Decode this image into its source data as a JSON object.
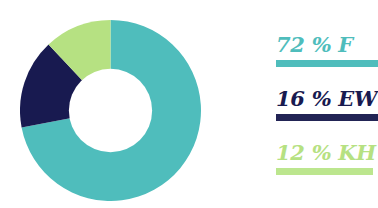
{
  "chart_data": {
    "type": "pie",
    "variant": "donut",
    "title": "",
    "subtitle": "",
    "xlabel": "",
    "ylabel": "",
    "grid": false,
    "legend_position": "right",
    "start_angle_deg": 0,
    "direction": "clockwise",
    "inner_radius_ratio": 0.46,
    "categories": [
      "F",
      "EW",
      "KH"
    ],
    "values": [
      72,
      16,
      12
    ],
    "value_unit": "%",
    "colors": [
      "#4FBDBC",
      "#181A50",
      "#B6E182"
    ],
    "data_labels": [
      "72 % F",
      "16 % EW",
      "12 % KH"
    ],
    "slices": [
      {
        "label": "F",
        "value": 72,
        "display": "72 % F",
        "color": "#4FBDBC"
      },
      {
        "label": "EW",
        "value": 16,
        "display": "16 % EW",
        "color": "#181A50"
      },
      {
        "label": "KH",
        "value": 12,
        "display": "12 % KH",
        "color": "#B6E182"
      }
    ]
  },
  "legend": {
    "items": [
      {
        "text": "72 % F",
        "color": "#4FBDBC",
        "rule_color": "#4FBDBC"
      },
      {
        "text": "16 % EW",
        "color": "#181A50",
        "rule_color": "#222455"
      },
      {
        "text": "12 % KH",
        "color": "#B6E182",
        "rule_color": "#BCE68E"
      }
    ]
  },
  "colors": {
    "teal": "#4FBDBC",
    "navy": "#181A50",
    "green": "#B6E182",
    "background": "#ffffff",
    "hole": "#ffffff"
  }
}
